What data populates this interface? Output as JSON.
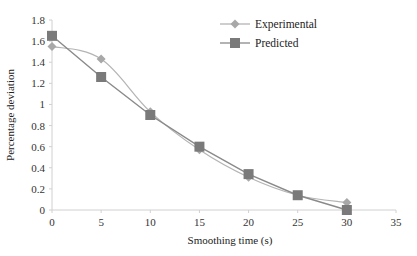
{
  "chart_data": {
    "type": "line",
    "title": "",
    "xlabel": "Smoothing time (s)",
    "ylabel": "Percentage deviation",
    "xlim": [
      0,
      35
    ],
    "ylim": [
      0,
      1.8
    ],
    "xticks": [
      0,
      5,
      10,
      15,
      20,
      25,
      30,
      35
    ],
    "yticks": [
      0,
      0.2,
      0.4,
      0.6,
      0.8,
      1,
      1.2,
      1.4,
      1.6,
      1.8
    ],
    "xtick_labels": [
      "0",
      "5",
      "10",
      "15",
      "20",
      "25",
      "30",
      "35"
    ],
    "ytick_labels": [
      "0",
      "0.2",
      "0.4",
      "0.6",
      "0.8",
      "1",
      "1.2",
      "1.4",
      "1.6",
      "1.8"
    ],
    "grid": false,
    "legend_position": "top-right",
    "x": [
      0,
      5,
      10,
      15,
      20,
      25,
      30
    ],
    "series": [
      {
        "name": "Experimental",
        "marker": "diamond",
        "smooth": true,
        "color": "#b4b4b4",
        "values": [
          1.55,
          1.43,
          0.93,
          0.57,
          0.31,
          0.14,
          0.07
        ]
      },
      {
        "name": "Predicted",
        "marker": "square",
        "smooth": false,
        "color": "#8a8a8a",
        "values": [
          1.65,
          1.26,
          0.9,
          0.6,
          0.34,
          0.14,
          0.0
        ]
      }
    ]
  }
}
